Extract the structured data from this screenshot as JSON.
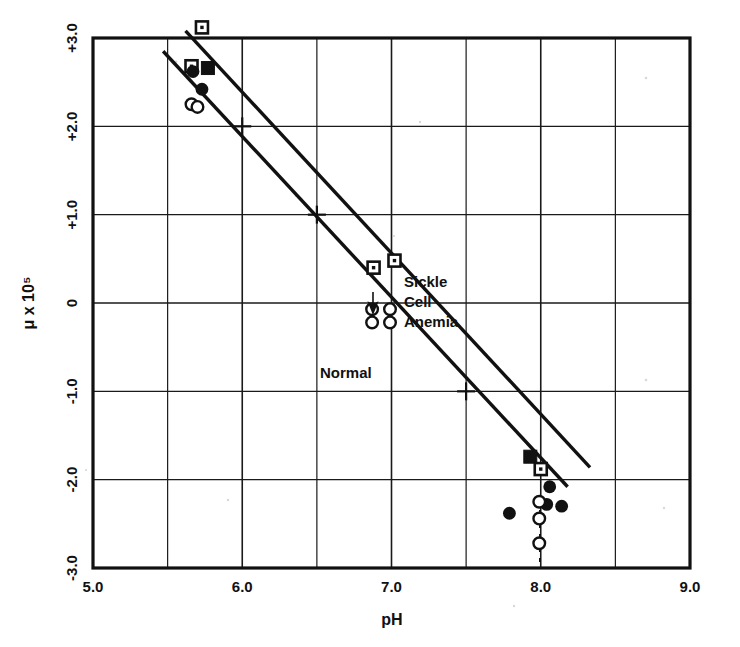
{
  "figure": {
    "kind": "scatter-plot",
    "background_color": "#ffffff",
    "ink_color": "#111111"
  },
  "chart_data": {
    "type": "scatter",
    "title": "",
    "subtitle": "",
    "xlabel": "pH",
    "ylabel": "μ  x  10⁵",
    "xlim": [
      5.0,
      9.0
    ],
    "ylim": [
      -3.0,
      3.0
    ],
    "grid": true,
    "x_major_step": 1.0,
    "x_minor_step": 0.5,
    "y_major_step": 1.0,
    "xticks": [
      5.0,
      6.0,
      7.0,
      8.0,
      9.0
    ],
    "xtick_labels": [
      "5.0",
      "6.0",
      "7.0",
      "8.0",
      "9.0"
    ],
    "yticks": [
      3.0,
      2.0,
      1.0,
      0.0,
      -1.0,
      -2.0,
      -3.0
    ],
    "ytick_labels": [
      "+3.0",
      "+2.0",
      "+1.0",
      "0",
      "-1.0",
      "-2.0",
      "-3.0"
    ],
    "legend_position": "inline-annotations",
    "series": [
      {
        "name": "Sickle Cell Anemia",
        "marker": "square-open",
        "points": [
          {
            "x": 5.73,
            "y": 3.12
          },
          {
            "x": 5.66,
            "y": 2.68
          },
          {
            "x": 6.88,
            "y": 0.4
          },
          {
            "x": 7.02,
            "y": 0.48
          },
          {
            "x": 8.0,
            "y": -1.88
          }
        ]
      },
      {
        "name": "Sickle Cell Anemia (filled)",
        "marker": "square-filled",
        "points": [
          {
            "x": 5.77,
            "y": 2.66
          },
          {
            "x": 7.93,
            "y": -1.74
          }
        ]
      },
      {
        "name": "Normal (filled)",
        "marker": "circle-filled",
        "points": [
          {
            "x": 5.67,
            "y": 2.62
          },
          {
            "x": 5.73,
            "y": 2.42
          },
          {
            "x": 8.06,
            "y": -2.08
          },
          {
            "x": 8.04,
            "y": -2.28
          },
          {
            "x": 8.14,
            "y": -2.3
          },
          {
            "x": 7.79,
            "y": -2.38
          }
        ]
      },
      {
        "name": "Normal (open)",
        "marker": "circle-open",
        "points": [
          {
            "x": 5.66,
            "y": 2.25
          },
          {
            "x": 5.7,
            "y": 2.22
          },
          {
            "x": 6.87,
            "y": -0.07
          },
          {
            "x": 6.87,
            "y": -0.22
          },
          {
            "x": 6.99,
            "y": -0.07
          },
          {
            "x": 6.99,
            "y": -0.22
          },
          {
            "x": 7.99,
            "y": -2.25
          },
          {
            "x": 7.99,
            "y": -2.44
          },
          {
            "x": 7.99,
            "y": -2.72
          }
        ]
      }
    ],
    "fit_lines": [
      {
        "name": "Sickle Cell Anemia fit",
        "x_start": 5.62,
        "y_start": 3.08,
        "x_end": 8.33,
        "y_end": -1.86,
        "style": "solid"
      },
      {
        "name": "Normal fit",
        "x_start": 5.47,
        "y_start": 2.85,
        "x_end": 8.18,
        "y_end": -2.08,
        "style": "solid"
      }
    ],
    "cross_marks": [
      {
        "x": 6.0,
        "y": 2.0
      },
      {
        "x": 6.5,
        "y": 1.0
      },
      {
        "x": 7.5,
        "y": -1.0
      }
    ],
    "annotations": [
      {
        "id": "sickle-label",
        "text_lines": [
          "Sickle",
          "Cell",
          "Anemia"
        ],
        "x": 7.05,
        "y": 0.95
      },
      {
        "id": "normal-label",
        "text_lines": [
          "Normal"
        ],
        "x": 6.55,
        "y": -0.48
      },
      {
        "id": "down-arrow",
        "text_lines": [],
        "x": 6.88,
        "y": 0.62
      }
    ]
  },
  "axis": {
    "x_title": "pH",
    "y_title": "μ  x  10⁵"
  },
  "labels": {
    "x": [
      "5.0",
      "6.0",
      "7.0",
      "8.0",
      "9.0"
    ],
    "y": [
      "+3.0",
      "+2.0",
      "+1.0",
      "0",
      "-1.0",
      "-2.0",
      "-3.0"
    ],
    "sickle_line1": "Sickle",
    "sickle_line2": "Cell",
    "sickle_line3": "Anemia",
    "normal": "Normal"
  }
}
